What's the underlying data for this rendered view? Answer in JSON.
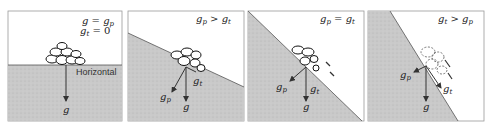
{
  "figure": {
    "panels": [
      {
        "id": "flat",
        "condition_lines": [
          {
            "base": "g",
            "eq": " = ",
            "rhs_base": "g",
            "rhs_sub": "p"
          },
          {
            "base": "g",
            "sub": "t",
            "eq": " = ",
            "rhs_plain": "0"
          }
        ],
        "surface_label": "Horizontal",
        "vectors": {
          "g": "g"
        }
      },
      {
        "id": "gentle-slope",
        "condition": {
          "a": "g",
          "a_sub": "p",
          "op": " > ",
          "b": "g",
          "b_sub": "t"
        },
        "vectors": {
          "g": "g",
          "gp": "g",
          "gp_sub": "p",
          "gt": "g",
          "gt_sub": "t"
        }
      },
      {
        "id": "critical-slope",
        "condition": {
          "a": "g",
          "a_sub": "p",
          "op": " = ",
          "b": "g",
          "b_sub": "t"
        },
        "vectors": {
          "g": "g",
          "gp": "g",
          "gp_sub": "p",
          "gt": "g",
          "gt_sub": "t"
        }
      },
      {
        "id": "steep-slope",
        "condition": {
          "a": "g",
          "a_sub": "t",
          "op": " > ",
          "b": "g",
          "b_sub": "p"
        },
        "vectors": {
          "g": "g",
          "gp": "g",
          "gp_sub": "p",
          "gt": "g",
          "gt_sub": "t"
        }
      }
    ],
    "colors": {
      "ground": "#c9c9c9",
      "ink": "#333333",
      "frame": "#9a9a9a"
    }
  }
}
